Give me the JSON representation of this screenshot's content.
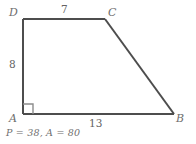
{
  "figure": {
    "type": "geometry-diagram",
    "shape": "trapezoid",
    "stroke_color": "#4d4d4d",
    "text_color": "#6b6b6b",
    "background_color": "#ffffff",
    "vertices": [
      {
        "name": "D",
        "label": "D",
        "x": 23,
        "y": 19
      },
      {
        "name": "C",
        "label": "C",
        "x": 105,
        "y": 19
      },
      {
        "name": "B",
        "label": "B",
        "x": 174,
        "y": 114
      },
      {
        "name": "A",
        "label": "A",
        "x": 23,
        "y": 114
      }
    ],
    "sides": [
      {
        "name": "DC",
        "label": "7"
      },
      {
        "name": "AD",
        "label": "8"
      },
      {
        "name": "AB",
        "label": "13"
      }
    ],
    "right_angle": {
      "at": "A",
      "size": 10
    },
    "caption": "P = 38, A = 80"
  }
}
